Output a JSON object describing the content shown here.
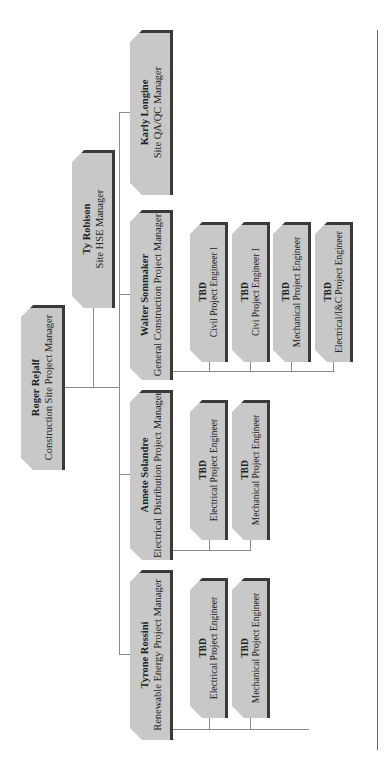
{
  "chart": {
    "root": {
      "name": "Roger Rejalf",
      "title": "Construction Site Project Manager"
    },
    "staff": {
      "name": "Ty Robison",
      "title": "Site HSE Manager"
    },
    "managers": [
      {
        "name": "Tyrone Rossini",
        "title": "Renewable Energy Project Manager",
        "engineers": [
          {
            "name": "TBD",
            "title": "Electrical Project Engineer"
          },
          {
            "name": "TBD",
            "title": "Mechanical Project Engineer"
          }
        ]
      },
      {
        "name": "Annete Solandre",
        "title": "Electrical Distribution Project Manager",
        "engineers": [
          {
            "name": "TBD",
            "title": "Electrical Project Engineer"
          },
          {
            "name": "TBD",
            "title": "Mechanical Project Engineer"
          }
        ]
      },
      {
        "name": "Walter Sommaker",
        "title": "General Construction Project Manager",
        "engineers": [
          {
            "name": "TBD",
            "title": "Civil Project Engineer I"
          },
          {
            "name": "TBD",
            "title": "Civi Project Engineer I"
          },
          {
            "name": "TBD",
            "title": "Mechanical Project Engineer"
          },
          {
            "name": "TBD",
            "title": "Electrical/I&C Project Engineer"
          }
        ]
      },
      {
        "name": "Karly Longine",
        "title": "Site QA/QC Manager",
        "engineers": []
      }
    ]
  },
  "colors": {
    "box_fill": "#c8c8c8",
    "box_shadow": "#3a3a3a",
    "connector": "#8a8a8a",
    "rule": "#6a6a6a"
  }
}
